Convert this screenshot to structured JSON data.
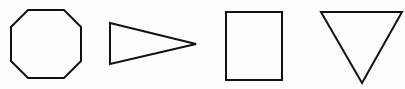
{
  "canvas": {
    "width": 405,
    "height": 89,
    "background_color": "#fefefe",
    "stroke_color": "#111111",
    "stroke_width": 2,
    "fill": "none",
    "description": "Four black outlined geometric shapes in a row on a white background"
  },
  "shapes": [
    {
      "id": "octagon",
      "name": "octagon",
      "sides": 8,
      "label": "Octagon",
      "orientation": "flat-top",
      "bounds": {
        "x": 11,
        "y": 10,
        "width": 70,
        "height": 68
      },
      "points": "28,10 64,10 81,27 81,61 64,78 28,78 11,61 11,27"
    },
    {
      "id": "right-triangle",
      "name": "right-pointing-triangle",
      "sides": 3,
      "label": "Triangle pointing right",
      "orientation": "right",
      "bounds": {
        "x": 110,
        "y": 23,
        "width": 86,
        "height": 41
      },
      "points": "110,23 196,44 110,64"
    },
    {
      "id": "rectangle",
      "name": "rectangle",
      "sides": 4,
      "label": "Rectangle",
      "orientation": "portrait",
      "bounds": {
        "x": 226,
        "y": 12,
        "width": 56,
        "height": 68
      },
      "points": "226,12 282,12 282,80 226,80"
    },
    {
      "id": "down-triangle",
      "name": "downward-pointing-triangle",
      "sides": 3,
      "label": "Triangle pointing down",
      "orientation": "down",
      "bounds": {
        "x": 321,
        "y": 12,
        "width": 81,
        "height": 71
      },
      "points": "321,12 402,12 362,83"
    }
  ]
}
